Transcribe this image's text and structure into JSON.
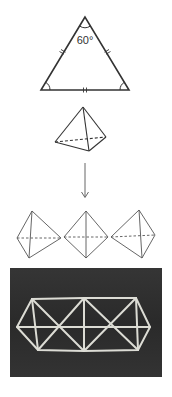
{
  "figure": {
    "panels": [
      {
        "id": "equilateral-triangle",
        "type": "triangle",
        "apex_angle_label": "60°",
        "side_marks": "double-tick",
        "angle_arcs": 3,
        "vertices": [
          [
            85,
            17
          ],
          [
            41,
            90
          ],
          [
            129,
            90
          ]
        ]
      },
      {
        "id": "tetrahedron",
        "type": "tetrahedron",
        "vertices": {
          "apex": [
            83,
            107
          ],
          "left": [
            55,
            142
          ],
          "front": [
            89,
            151
          ],
          "right": [
            106,
            137
          ]
        },
        "hidden_edge": "left-right"
      },
      {
        "id": "transform-arrow",
        "type": "arrow",
        "direction": "down",
        "from": [
          85,
          163
        ],
        "to": [
          85,
          197
        ]
      },
      {
        "id": "three-octahedra",
        "type": "octahedra-row",
        "count": 3,
        "shapes": [
          {
            "top": [
              32,
              211
            ],
            "left": [
              17,
              238
            ],
            "right": [
              61,
              238
            ],
            "bottom": [
              29,
              258
            ]
          },
          {
            "top": [
              86,
              211
            ],
            "left": [
              64,
              237
            ],
            "right": [
              108,
              237
            ],
            "bottom": [
              86,
              258
            ]
          },
          {
            "top": [
              139,
              210
            ],
            "left": [
              111,
              237
            ],
            "right": [
              155,
              235
            ],
            "bottom": [
              142,
              258
            ]
          }
        ]
      },
      {
        "id": "photo-framework",
        "type": "photo",
        "description": "stick framework model on dark background",
        "background_color": "#2b2b2b",
        "stick_color": "#e8e8e0",
        "bounds": {
          "x": 10,
          "y": 268,
          "w": 152,
          "h": 109
        }
      }
    ],
    "colors": {
      "line": "#333333",
      "light_line": "#555555",
      "photo_bg": "#2a2a2a"
    }
  }
}
